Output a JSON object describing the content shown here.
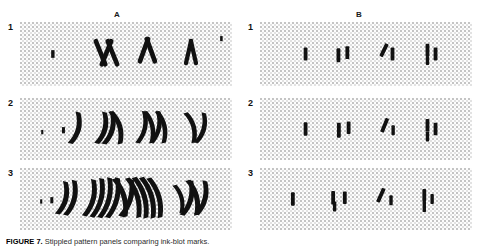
{
  "figure": {
    "columns": [
      {
        "id": "A",
        "label": "A"
      },
      {
        "id": "B",
        "label": "B"
      }
    ],
    "rows": [
      {
        "id": "1",
        "label": "1"
      },
      {
        "id": "2",
        "label": "2"
      },
      {
        "id": "3",
        "label": "3"
      }
    ],
    "caption_lead": "FIGURE 7.",
    "caption_text": " Stippled pattern panels comparing ink-blot marks.",
    "ink_color": "#111111",
    "stipple_color": "#969696",
    "panel_background": "#fdfdfd"
  },
  "chart_data": {
    "type": "scatter",
    "title": "",
    "xlabel": "",
    "ylabel": "",
    "grid": false,
    "legend": "none",
    "layout": {
      "columns": [
        "A",
        "B"
      ],
      "rows": [
        "1",
        "2",
        "3"
      ]
    },
    "panels": [
      {
        "column": "A",
        "row": "1",
        "mark_count": 9,
        "description": "sparse row: single dot, bowtie, V-shape, vertical lens",
        "marks": [
          {
            "x": 0.155,
            "y": 0.5,
            "w": 0.016,
            "h": 0.12,
            "rot": 0,
            "shape": "dot"
          },
          {
            "x": 0.38,
            "y": 0.48,
            "w": 0.022,
            "h": 0.46,
            "rot": -22,
            "shape": "stroke"
          },
          {
            "x": 0.408,
            "y": 0.48,
            "w": 0.022,
            "h": 0.46,
            "rot": 22,
            "shape": "stroke"
          },
          {
            "x": 0.436,
            "y": 0.48,
            "w": 0.022,
            "h": 0.46,
            "rot": -22,
            "shape": "stroke"
          },
          {
            "x": 0.585,
            "y": 0.44,
            "w": 0.022,
            "h": 0.44,
            "rot": 20,
            "shape": "stroke"
          },
          {
            "x": 0.617,
            "y": 0.44,
            "w": 0.022,
            "h": 0.44,
            "rot": -20,
            "shape": "stroke"
          },
          {
            "x": 0.795,
            "y": 0.47,
            "w": 0.02,
            "h": 0.42,
            "rot": 13,
            "shape": "stroke"
          },
          {
            "x": 0.818,
            "y": 0.47,
            "w": 0.02,
            "h": 0.42,
            "rot": -13,
            "shape": "stroke"
          },
          {
            "x": 0.95,
            "y": 0.26,
            "w": 0.012,
            "h": 0.08,
            "rot": 0,
            "shape": "dot"
          }
        ]
      },
      {
        "column": "A",
        "row": "2",
        "mark_count": 12,
        "description": "medium row: dot plus curved strokes, triple strokes, W pair, parentheses",
        "marks": [
          {
            "x": 0.205,
            "y": 0.52,
            "w": 0.014,
            "h": 0.1,
            "rot": 0,
            "shape": "dot"
          },
          {
            "x": 0.255,
            "y": 0.48,
            "w": 0.024,
            "h": 0.52,
            "rot": 14,
            "shape": "arc"
          },
          {
            "x": 0.38,
            "y": 0.48,
            "w": 0.024,
            "h": 0.52,
            "rot": 14,
            "shape": "arc"
          },
          {
            "x": 0.415,
            "y": 0.48,
            "w": 0.024,
            "h": 0.54,
            "rot": 14,
            "shape": "arc"
          },
          {
            "x": 0.45,
            "y": 0.48,
            "w": 0.024,
            "h": 0.54,
            "rot": -16,
            "shape": "arc"
          },
          {
            "x": 0.57,
            "y": 0.47,
            "w": 0.022,
            "h": 0.52,
            "rot": 12,
            "shape": "arc"
          },
          {
            "x": 0.605,
            "y": 0.47,
            "w": 0.022,
            "h": 0.52,
            "rot": -12,
            "shape": "arc"
          },
          {
            "x": 0.636,
            "y": 0.47,
            "w": 0.022,
            "h": 0.52,
            "rot": 12,
            "shape": "arc"
          },
          {
            "x": 0.662,
            "y": 0.47,
            "w": 0.022,
            "h": 0.52,
            "rot": -12,
            "shape": "arc"
          },
          {
            "x": 0.8,
            "y": 0.48,
            "w": 0.022,
            "h": 0.5,
            "rot": -15,
            "shape": "arc"
          },
          {
            "x": 0.848,
            "y": 0.48,
            "w": 0.022,
            "h": 0.5,
            "rot": 15,
            "shape": "arc"
          },
          {
            "x": 0.105,
            "y": 0.55,
            "w": 0.01,
            "h": 0.07,
            "rot": 0,
            "shape": "dot"
          }
        ]
      },
      {
        "column": "A",
        "row": "3",
        "mark_count": 18,
        "description": "dense row: many nested arc clusters spanning the panel",
        "marks": [
          {
            "x": 0.15,
            "y": 0.52,
            "w": 0.014,
            "h": 0.1,
            "rot": 0,
            "shape": "dot"
          },
          {
            "x": 0.195,
            "y": 0.48,
            "w": 0.024,
            "h": 0.54,
            "rot": 14,
            "shape": "arc"
          },
          {
            "x": 0.235,
            "y": 0.48,
            "w": 0.024,
            "h": 0.58,
            "rot": 14,
            "shape": "arc"
          },
          {
            "x": 0.325,
            "y": 0.48,
            "w": 0.024,
            "h": 0.6,
            "rot": 14,
            "shape": "arc"
          },
          {
            "x": 0.362,
            "y": 0.48,
            "w": 0.024,
            "h": 0.64,
            "rot": 14,
            "shape": "arc"
          },
          {
            "x": 0.399,
            "y": 0.48,
            "w": 0.024,
            "h": 0.66,
            "rot": 14,
            "shape": "arc"
          },
          {
            "x": 0.436,
            "y": 0.48,
            "w": 0.024,
            "h": 0.66,
            "rot": 14,
            "shape": "arc"
          },
          {
            "x": 0.47,
            "y": 0.48,
            "w": 0.024,
            "h": 0.64,
            "rot": -16,
            "shape": "arc"
          },
          {
            "x": 0.5,
            "y": 0.48,
            "w": 0.024,
            "h": 0.62,
            "rot": 16,
            "shape": "arc"
          },
          {
            "x": 0.533,
            "y": 0.48,
            "w": 0.024,
            "h": 0.66,
            "rot": -16,
            "shape": "arc"
          },
          {
            "x": 0.566,
            "y": 0.48,
            "w": 0.024,
            "h": 0.68,
            "rot": -16,
            "shape": "arc"
          },
          {
            "x": 0.6,
            "y": 0.48,
            "w": 0.024,
            "h": 0.68,
            "rot": -16,
            "shape": "arc"
          },
          {
            "x": 0.634,
            "y": 0.48,
            "w": 0.024,
            "h": 0.66,
            "rot": -16,
            "shape": "arc"
          },
          {
            "x": 0.745,
            "y": 0.5,
            "w": 0.02,
            "h": 0.46,
            "rot": -14,
            "shape": "arc"
          },
          {
            "x": 0.785,
            "y": 0.48,
            "w": 0.024,
            "h": 0.58,
            "rot": 14,
            "shape": "arc"
          },
          {
            "x": 0.812,
            "y": 0.48,
            "w": 0.024,
            "h": 0.58,
            "rot": -14,
            "shape": "arc"
          },
          {
            "x": 0.852,
            "y": 0.48,
            "w": 0.024,
            "h": 0.56,
            "rot": 14,
            "shape": "arc"
          },
          {
            "x": 0.1,
            "y": 0.54,
            "w": 0.01,
            "h": 0.07,
            "rot": 0,
            "shape": "dot"
          }
        ]
      },
      {
        "column": "B",
        "row": "1",
        "mark_count": 8,
        "description": "sparse row: isolated short vertical bars in four loose clusters",
        "marks": [
          {
            "x": 0.215,
            "y": 0.5,
            "w": 0.018,
            "h": 0.2,
            "rot": 0,
            "shape": "bar"
          },
          {
            "x": 0.37,
            "y": 0.52,
            "w": 0.018,
            "h": 0.22,
            "rot": 0,
            "shape": "bar"
          },
          {
            "x": 0.412,
            "y": 0.48,
            "w": 0.018,
            "h": 0.2,
            "rot": 0,
            "shape": "bar"
          },
          {
            "x": 0.585,
            "y": 0.44,
            "w": 0.018,
            "h": 0.22,
            "rot": 26,
            "shape": "bar"
          },
          {
            "x": 0.625,
            "y": 0.5,
            "w": 0.018,
            "h": 0.2,
            "rot": 0,
            "shape": "bar"
          },
          {
            "x": 0.79,
            "y": 0.44,
            "w": 0.018,
            "h": 0.2,
            "rot": 0,
            "shape": "bar"
          },
          {
            "x": 0.79,
            "y": 0.6,
            "w": 0.016,
            "h": 0.14,
            "rot": 0,
            "shape": "bar"
          },
          {
            "x": 0.828,
            "y": 0.5,
            "w": 0.018,
            "h": 0.2,
            "rot": 0,
            "shape": "bar"
          }
        ]
      },
      {
        "column": "B",
        "row": "2",
        "mark_count": 8,
        "description": "sparse row: short vertical bars, one slanted, grouped in four clusters",
        "marks": [
          {
            "x": 0.215,
            "y": 0.5,
            "w": 0.018,
            "h": 0.22,
            "rot": 0,
            "shape": "bar"
          },
          {
            "x": 0.372,
            "y": 0.52,
            "w": 0.018,
            "h": 0.24,
            "rot": 0,
            "shape": "bar"
          },
          {
            "x": 0.418,
            "y": 0.48,
            "w": 0.018,
            "h": 0.2,
            "rot": 0,
            "shape": "bar"
          },
          {
            "x": 0.588,
            "y": 0.44,
            "w": 0.018,
            "h": 0.24,
            "rot": 22,
            "shape": "bar"
          },
          {
            "x": 0.628,
            "y": 0.52,
            "w": 0.016,
            "h": 0.16,
            "rot": 0,
            "shape": "bar"
          },
          {
            "x": 0.79,
            "y": 0.44,
            "w": 0.018,
            "h": 0.2,
            "rot": 0,
            "shape": "bar"
          },
          {
            "x": 0.79,
            "y": 0.62,
            "w": 0.016,
            "h": 0.16,
            "rot": 0,
            "shape": "bar"
          },
          {
            "x": 0.828,
            "y": 0.5,
            "w": 0.018,
            "h": 0.2,
            "rot": 0,
            "shape": "bar"
          }
        ]
      },
      {
        "column": "B",
        "row": "3",
        "mark_count": 8,
        "description": "sparse row: short vertical bars in four clusters, one slanted",
        "marks": [
          {
            "x": 0.155,
            "y": 0.5,
            "w": 0.018,
            "h": 0.22,
            "rot": 0,
            "shape": "bar"
          },
          {
            "x": 0.345,
            "y": 0.48,
            "w": 0.018,
            "h": 0.22,
            "rot": 0,
            "shape": "bar"
          },
          {
            "x": 0.352,
            "y": 0.62,
            "w": 0.016,
            "h": 0.16,
            "rot": 0,
            "shape": "bar"
          },
          {
            "x": 0.4,
            "y": 0.48,
            "w": 0.018,
            "h": 0.2,
            "rot": 0,
            "shape": "bar"
          },
          {
            "x": 0.57,
            "y": 0.44,
            "w": 0.018,
            "h": 0.24,
            "rot": 24,
            "shape": "bar"
          },
          {
            "x": 0.618,
            "y": 0.52,
            "w": 0.016,
            "h": 0.16,
            "rot": 0,
            "shape": "bar"
          },
          {
            "x": 0.775,
            "y": 0.44,
            "w": 0.018,
            "h": 0.2,
            "rot": 0,
            "shape": "bar"
          },
          {
            "x": 0.775,
            "y": 0.62,
            "w": 0.016,
            "h": 0.18,
            "rot": 0,
            "shape": "bar"
          },
          {
            "x": 0.812,
            "y": 0.5,
            "w": 0.016,
            "h": 0.16,
            "rot": 0,
            "shape": "bar"
          }
        ]
      }
    ]
  }
}
